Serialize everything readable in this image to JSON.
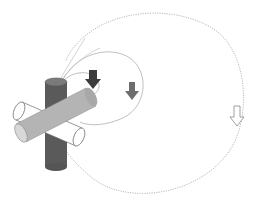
{
  "diagram": {
    "colors": {
      "background": "#ffffff",
      "path_stroke": "#a8a8a8",
      "vertical_cylinder": "#5a5a5a",
      "vertical_cylinder_top": "#7a7a7a",
      "diagonal_cylinder": "#b4b4b4",
      "diagonal_cylinder_end": "#d8d8d8",
      "horizontal_cylinder": "#ffffff",
      "outline": "#6a6a6a",
      "arrow_inner": "#3c3c3c",
      "arrow_middle": "#6e6e6e",
      "arrow_outer": "#ffffff"
    },
    "paths": [
      {
        "name": "inner-orbit",
        "style": "solid"
      },
      {
        "name": "middle-orbit",
        "style": "solid"
      },
      {
        "name": "outer-orbit",
        "style": "dotted"
      }
    ],
    "arrows": [
      {
        "name": "inner-force-arrow",
        "direction": "down",
        "fill": "dark"
      },
      {
        "name": "middle-force-arrow",
        "direction": "down",
        "fill": "medium"
      },
      {
        "name": "outer-force-arrow",
        "direction": "down",
        "fill": "hollow"
      }
    ]
  }
}
